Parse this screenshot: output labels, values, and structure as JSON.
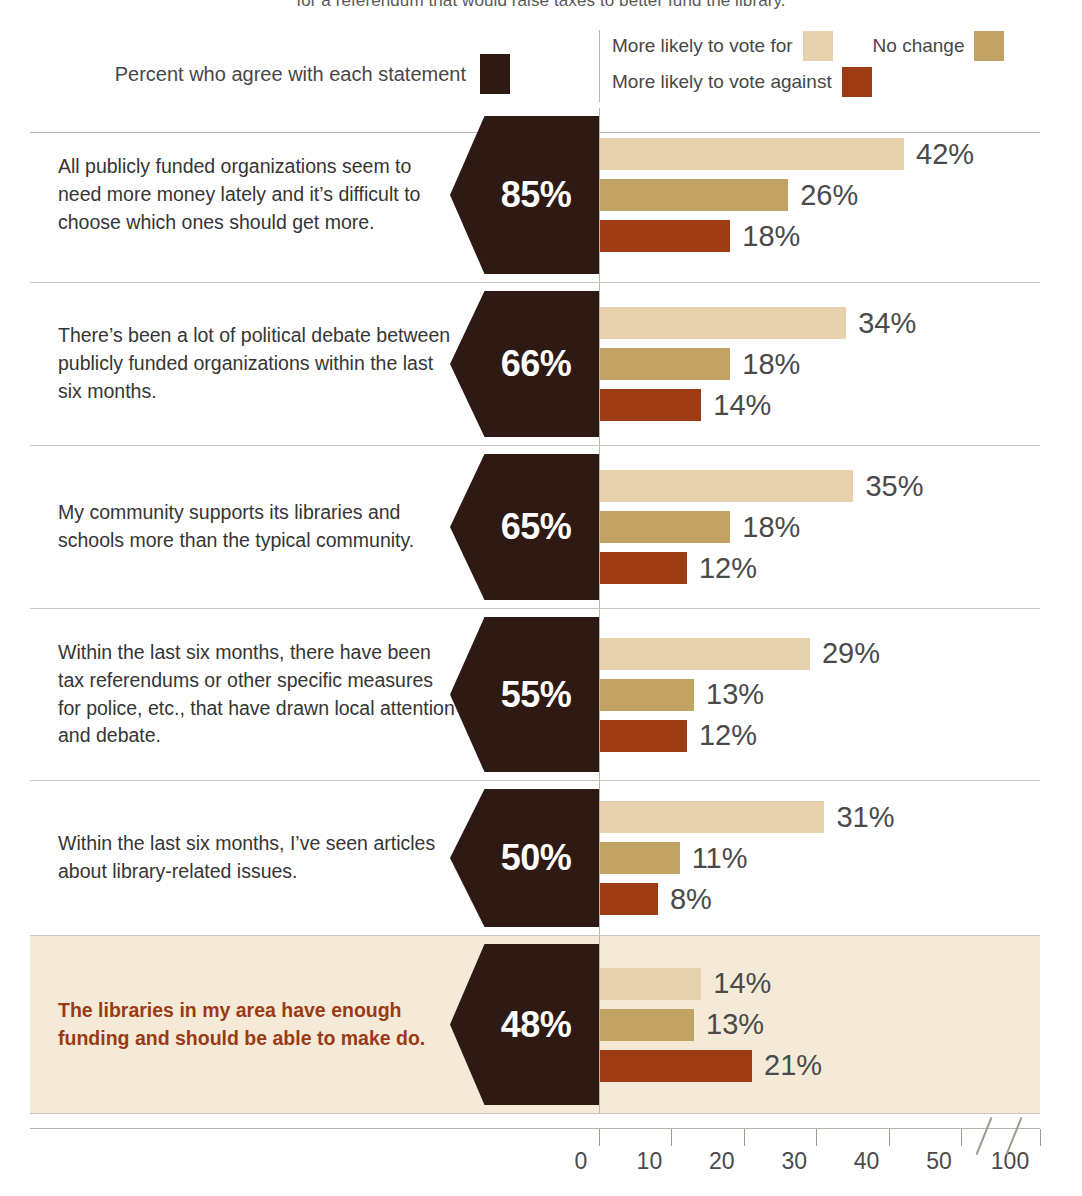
{
  "title": "for a referendum that would raise taxes to better fund the library.",
  "legend": {
    "agree_label": "Percent who agree with each statement",
    "agree_color": "#2e1a13",
    "vote_for_label": "More likely to vote for",
    "vote_for_color": "#e7d2ad",
    "no_change_label": "No change",
    "no_change_color": "#c2a263",
    "vote_against_label": "More likely to vote against",
    "vote_against_color": "#9d3c12"
  },
  "highlight": {
    "background": "#f5ead7",
    "text_color": "#9a3b16"
  },
  "axis": {
    "ticks": [
      "0",
      "10",
      "20",
      "30",
      "40",
      "50",
      "100"
    ],
    "break_between": [
      "50",
      "100"
    ]
  },
  "rows": [
    {
      "statement": "All publicly funded organizations seem to need more money lately and it’s difficult to choose which ones should get more.",
      "agree": "85%",
      "for": "42%",
      "no_change": "26%",
      "against": "18%"
    },
    {
      "statement": "There’s been a lot of political debate between publicly funded organizations within the last six months.",
      "agree": "66%",
      "for": "34%",
      "no_change": "18%",
      "against": "14%"
    },
    {
      "statement": "My community supports its libraries and schools more than the typical community.",
      "agree": "65%",
      "for": "35%",
      "no_change": "18%",
      "against": "12%"
    },
    {
      "statement": "Within the last six months, there have been tax referendums or other specific measures for police, etc., that have drawn local attention and debate.",
      "agree": "55%",
      "for": "29%",
      "no_change": "13%",
      "against": "12%"
    },
    {
      "statement": "Within the last six months, I’ve seen articles about library-related issues.",
      "agree": "50%",
      "for": "31%",
      "no_change": "11%",
      "against": "8%"
    },
    {
      "statement": "The libraries in my area have enough funding and should be able to make do.",
      "agree": "48%",
      "for": "14%",
      "no_change": "13%",
      "against": "21%"
    }
  ],
  "chart_data": {
    "type": "bar",
    "title": "for a referendum that would raise taxes to better fund the library.",
    "xlabel": "",
    "ylabel": "",
    "xlim": [
      0,
      50
    ],
    "grid": false,
    "legend_position": "top",
    "orientation": "horizontal",
    "axis_break": "between 50 and 100",
    "categories": [
      "All publicly funded organizations seem to need more money lately and it’s difficult to choose which ones should get more.",
      "There’s been a lot of political debate between publicly funded organizations within the last six months.",
      "My community supports its libraries and schools more than the typical community.",
      "Within the last six months, there have been tax referendums or other specific measures for police, etc., that have drawn local attention and debate.",
      "Within the last six months, I’ve seen articles about library-related issues.",
      "The libraries in my area have enough funding and should be able to make do."
    ],
    "series": [
      {
        "name": "Percent who agree with each statement",
        "color": "#2e1a13",
        "values": [
          85,
          66,
          65,
          55,
          50,
          48
        ]
      },
      {
        "name": "More likely to vote for",
        "color": "#e7d2ad",
        "values": [
          42,
          34,
          35,
          29,
          31,
          14
        ]
      },
      {
        "name": "No change",
        "color": "#c2a263",
        "values": [
          26,
          18,
          18,
          13,
          11,
          13
        ]
      },
      {
        "name": "More likely to vote against",
        "color": "#9d3c12",
        "values": [
          18,
          14,
          12,
          12,
          8,
          21
        ]
      }
    ]
  }
}
